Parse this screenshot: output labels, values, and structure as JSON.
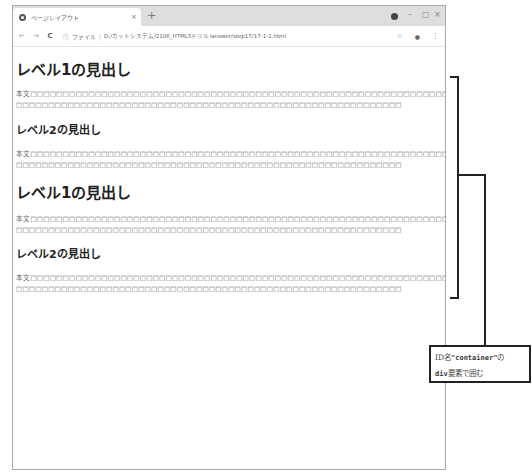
{
  "browser": {
    "tab": {
      "title": "ページレイアウト",
      "close_glyph": "×",
      "icon": "globe-icon"
    },
    "new_tab_glyph": "+",
    "window_controls": {
      "minimize": "–",
      "maximize": "□",
      "close": "×"
    },
    "address_bar": {
      "back_glyph": "←",
      "forward_glyph": "→",
      "reload_glyph": "C",
      "info_glyph": "ⓘ",
      "scheme_label": "ファイル",
      "separator": "|",
      "url": "D:/カットシステム/2106_HTML5ドリル/answer/step17/17-1-1.html",
      "bookmark_glyph": "☆",
      "profile_glyph": "●",
      "menu_glyph": "⋮"
    }
  },
  "page": {
    "sections": [
      {
        "h1": "レベル1の見出し",
        "p1": {
          "line1": "本文□□□□□□□□□□□□□□□□□□□□□□□□□□□□□□□□□□□□□□□□□□□□□□□□□□□□□□□□□□□□□□□□□□□",
          "line2": "□□□□□□□□□□□□□□□□□□□□□□□□□□□□□□□□□□□□□□□□□□□□□□□□□□□□□□□□□□□□"
        },
        "h2": "レベル2の見出し",
        "p2": {
          "line1": "本文□□□□□□□□□□□□□□□□□□□□□□□□□□□□□□□□□□□□□□□□□□□□□□□□□□□□□□□□□□□□□□□□□□□",
          "line2": "□□□□□□□□□□□□□□□□□□□□□□□□□□□□□□□□□□□□□□□□□□□□□□□□□□□□□□□□□□□□"
        }
      },
      {
        "h1": "レベル1の見出し",
        "p1": {
          "line1": "本文□□□□□□□□□□□□□□□□□□□□□□□□□□□□□□□□□□□□□□□□□□□□□□□□□□□□□□□□□□□□□□□□□□□",
          "line2": "□□□□□□□□□□□□□□□□□□□□□□□□□□□□□□□□□□□□□□□□□□□□□□□□□□□□□□□□□□□□"
        },
        "h2": "レベル2の見出し",
        "p2": {
          "line1": "本文□□□□□□□□□□□□□□□□□□□□□□□□□□□□□□□□□□□□□□□□□□□□□□□□□□□□□□□□□□□□□□□□□□□",
          "line2": "□□□□□□□□□□□□□□□□□□□□□□□□□□□□□□□□□□□□□□□□□□□□□□□□□□□□□□□□□□□□"
        }
      }
    ]
  },
  "annotation": {
    "line1_prefix": "ID名",
    "line1_code": "\"container\"",
    "line1_suffix": "の",
    "line2_code": "div",
    "line2_suffix": "要素で囲む"
  }
}
